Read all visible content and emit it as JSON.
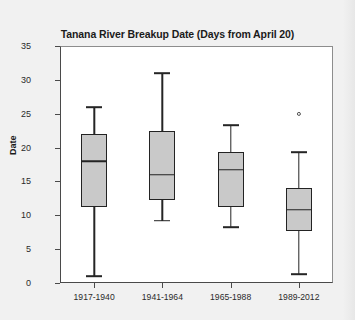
{
  "chart_data": {
    "type": "box",
    "title": "Tanana River Breakup Date (Days from April 20)",
    "xlabel": "",
    "ylabel": "Date",
    "ylim": [
      0,
      35
    ],
    "yticks": [
      0,
      5,
      10,
      15,
      20,
      25,
      30,
      35
    ],
    "ytick_labels": [
      "0",
      "5",
      "10",
      "15",
      "20",
      "25",
      "30",
      "35"
    ],
    "grid": false,
    "legend": "none",
    "categories": [
      "1917-1940",
      "1941-1964",
      "1965-1988",
      "1989-2012"
    ],
    "boxes": [
      {
        "category": "1917-1940",
        "whisker_low": 1.0,
        "q1": 11.2,
        "median": 18.0,
        "q3": 22.0,
        "whisker_high": 26.0,
        "outliers": []
      },
      {
        "category": "1941-1964",
        "whisker_low": 9.2,
        "q1": 12.3,
        "median": 16.0,
        "q3": 22.4,
        "whisker_high": 31.0,
        "outliers": []
      },
      {
        "category": "1965-1988",
        "whisker_low": 8.2,
        "q1": 11.2,
        "median": 16.7,
        "q3": 19.3,
        "whisker_high": 23.3,
        "outliers": []
      },
      {
        "category": "1989-2012",
        "whisker_low": 1.3,
        "q1": 7.7,
        "median": 10.8,
        "q3": 14.0,
        "whisker_high": 19.3,
        "outliers": [
          25.0
        ]
      }
    ],
    "colors": {
      "box_fill": "#c9c9c9",
      "box_edge": "#232323",
      "axis": "#4a4a4a",
      "text": "#1b1b1b",
      "plot_background": "#ffffff",
      "figure_background": "#f1f1f1"
    }
  }
}
